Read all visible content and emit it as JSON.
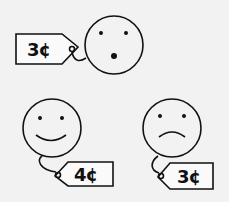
{
  "illustration": {
    "background": "#f2f2f2",
    "ink": "#111111",
    "items": [
      {
        "expression": "surprised",
        "price": "3¢",
        "position": "top"
      },
      {
        "expression": "happy",
        "price": "4¢",
        "position": "bottom-left"
      },
      {
        "expression": "sad",
        "price": "3¢",
        "position": "bottom-right"
      }
    ]
  }
}
